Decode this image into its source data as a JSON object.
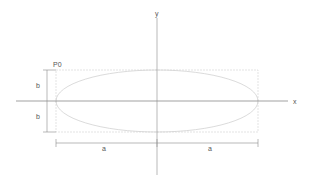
{
  "diagram": {
    "title": "",
    "labels": {
      "y_axis": "y",
      "x_axis": "x",
      "p0": "P0",
      "b_upper": "b",
      "b_lower": "b",
      "a_left": "a",
      "a_right": "a"
    },
    "colors": {
      "axis": "#7a7a7a",
      "dimension": "#8a8a8a",
      "ellipse": "#d2d2d2",
      "bounding_box": "#dcdcdc",
      "text": "#555555",
      "background": "#ffffff"
    },
    "geometry": {
      "center": [
        157,
        101
      ],
      "semi_axis_a": 101,
      "semi_axis_b": 31,
      "bounding_box": {
        "x": 56,
        "y": 70,
        "width": 202,
        "height": 62
      }
    }
  }
}
